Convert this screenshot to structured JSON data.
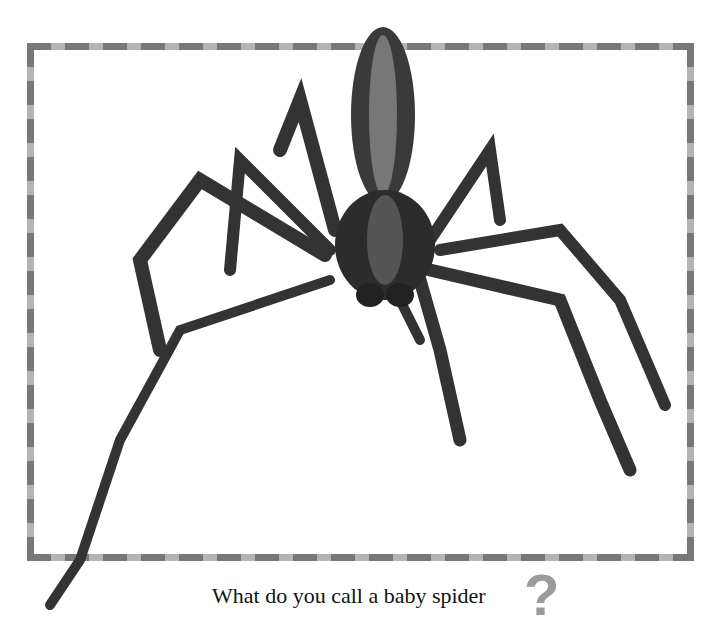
{
  "caption": {
    "text": "What do you call a baby spider",
    "mark": "?"
  },
  "image": {
    "subject": "spider-photo"
  },
  "colors": {
    "border_dark": "#787878",
    "border_light": "#b4b4b4",
    "question_mark": "#9a9a9a"
  }
}
